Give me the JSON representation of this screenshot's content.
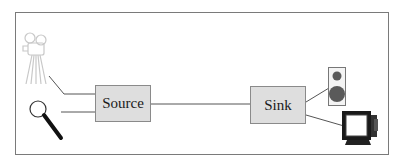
{
  "diagram": {
    "nodes": {
      "source": {
        "label": "Source"
      },
      "sink": {
        "label": "Sink"
      }
    },
    "inputs": [
      {
        "icon": "movie-camera-icon",
        "target": "source"
      },
      {
        "icon": "magnifying-glass-icon",
        "target": "source"
      }
    ],
    "outputs": [
      {
        "icon": "speaker-icon",
        "from": "sink"
      },
      {
        "icon": "monitor-icon",
        "from": "sink"
      }
    ],
    "edges": [
      {
        "from": "movie-camera",
        "to": "source"
      },
      {
        "from": "magnifying-glass",
        "to": "source"
      },
      {
        "from": "source",
        "to": "sink"
      },
      {
        "from": "sink",
        "to": "speaker"
      },
      {
        "from": "sink",
        "to": "monitor"
      }
    ],
    "colors": {
      "box_fill": "#dedede",
      "box_border": "#8a8a8a",
      "line": "#555555",
      "frame": "#7a7a7a"
    }
  }
}
